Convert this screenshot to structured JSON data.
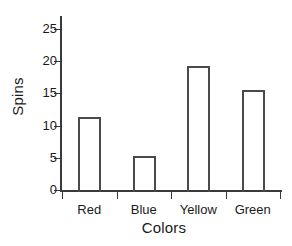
{
  "chart_data": {
    "type": "bar",
    "title": "",
    "xlabel": "Colors",
    "ylabel": "Spins",
    "categories": [
      "Red",
      "Blue",
      "Yellow",
      "Green"
    ],
    "values": [
      11.4,
      5.3,
      19.3,
      15.5
    ],
    "ylim": [
      0,
      27
    ],
    "yticks": [
      0,
      5,
      10,
      15,
      20,
      25
    ],
    "ytick_labels": [
      "0",
      "5",
      "10",
      "15",
      "20",
      "25"
    ],
    "grid": false,
    "legend": null,
    "legend_position": "none",
    "bar_style": {
      "fill": "none",
      "edge_color": "#4a4a4a",
      "axis_color": "#3a3a3a",
      "background": "#ffffff"
    }
  }
}
